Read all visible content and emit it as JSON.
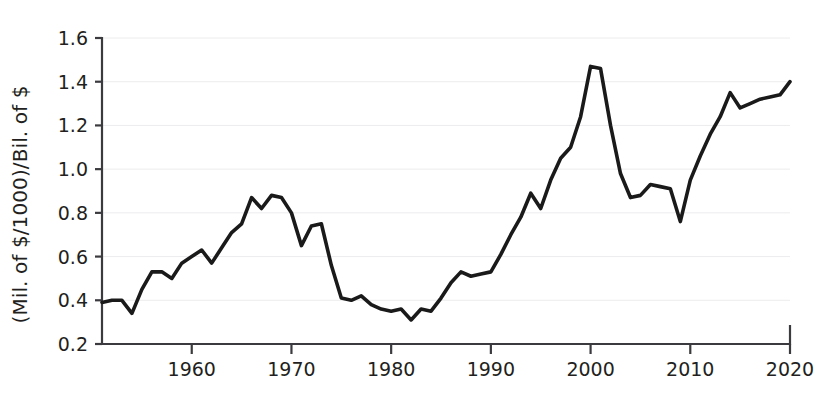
{
  "chart_data": {
    "type": "line",
    "title": "",
    "subtitle": "",
    "xlabel": "",
    "ylabel": "(Mil. of $/1000)/Bil. of $",
    "xlim": [
      1951,
      2020
    ],
    "ylim": [
      0.2,
      1.6
    ],
    "grid": true,
    "legend": "none",
    "x_ticks": [
      1960,
      1970,
      1980,
      1990,
      2000,
      2010,
      2020
    ],
    "x_tick_labels": [
      "1960",
      "1970",
      "1980",
      "1990",
      "2000",
      "2010",
      "2020"
    ],
    "y_ticks": [
      0.2,
      0.4,
      0.6,
      0.8,
      1.0,
      1.2,
      1.4,
      1.6
    ],
    "y_tick_labels": [
      "0.2",
      "0.4",
      "0.6",
      "0.8",
      "1.0",
      "1.2",
      "1.4",
      "1.6"
    ],
    "line_color": "#1a1a1a",
    "grid_color": "#ececee",
    "axis_color": "#3b3b3f",
    "background_color": "#ffffff",
    "x": [
      1951,
      1952,
      1953,
      1954,
      1955,
      1956,
      1957,
      1958,
      1959,
      1960,
      1961,
      1962,
      1963,
      1964,
      1965,
      1966,
      1967,
      1968,
      1969,
      1970,
      1971,
      1972,
      1973,
      1974,
      1975,
      1976,
      1977,
      1978,
      1979,
      1980,
      1981,
      1982,
      1983,
      1984,
      1985,
      1986,
      1987,
      1988,
      1989,
      1990,
      1991,
      1992,
      1993,
      1994,
      1995,
      1996,
      1997,
      1998,
      1999,
      2000,
      2001,
      2002,
      2003,
      2004,
      2005,
      2006,
      2007,
      2008,
      2009,
      2010,
      2011,
      2012,
      2013,
      2014,
      2015,
      2016,
      2017,
      2018,
      2019,
      2020
    ],
    "y": [
      0.39,
      0.4,
      0.4,
      0.34,
      0.45,
      0.53,
      0.53,
      0.5,
      0.57,
      0.6,
      0.63,
      0.57,
      0.64,
      0.71,
      0.75,
      0.87,
      0.82,
      0.88,
      0.87,
      0.8,
      0.65,
      0.74,
      0.75,
      0.56,
      0.41,
      0.4,
      0.42,
      0.38,
      0.36,
      0.35,
      0.36,
      0.31,
      0.36,
      0.35,
      0.41,
      0.48,
      0.53,
      0.51,
      0.52,
      0.53,
      0.61,
      0.7,
      0.78,
      0.89,
      0.82,
      0.95,
      1.05,
      1.1,
      1.24,
      1.47,
      1.46,
      1.2,
      0.98,
      0.87,
      0.88,
      0.93,
      0.92,
      0.91,
      0.76,
      0.95,
      1.06,
      1.16,
      1.24,
      1.35,
      1.28,
      1.3,
      1.32,
      1.33,
      1.34,
      1.4
    ]
  },
  "axis": {
    "y_label": "(Mil. of $/1000)/Bil. of $"
  }
}
